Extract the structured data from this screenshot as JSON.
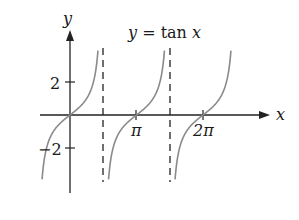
{
  "chart_data": {
    "type": "line",
    "title": "y = tan x",
    "xlabel": "x",
    "ylabel": "y",
    "x_ticks": [
      {
        "value": 3.14159,
        "label": "π"
      },
      {
        "value": 6.28318,
        "label": "2π"
      }
    ],
    "y_ticks": [
      {
        "value": 2,
        "label": "2"
      },
      {
        "value": -2,
        "label": "-2"
      }
    ],
    "asymptotes": [
      1.5708,
      4.7124
    ],
    "series": [
      {
        "name": "tan x",
        "function": "tan(x)",
        "x_range": [
          -1.3,
          7.6
        ],
        "color": "#8a8a8a"
      }
    ],
    "xlim": [
      -1.6,
      8.4
    ],
    "ylim": [
      -4,
      4
    ],
    "grid": false
  },
  "labels": {
    "title": "y = tan x",
    "x_axis": "x",
    "y_axis": "y",
    "tick_pi": "π",
    "tick_2pi": "2π",
    "tick_2": "2",
    "tick_neg2": "−2"
  }
}
